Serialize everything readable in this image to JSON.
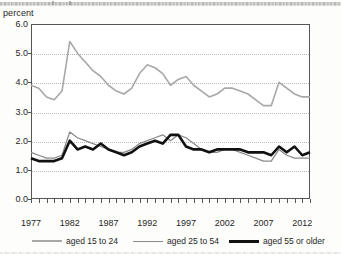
{
  "axis_title": "percent",
  "legend": {
    "items": [
      {
        "label": "aged 15 to 24",
        "color": "#a8a8a8"
      },
      {
        "label": "aged 25 to 54",
        "color": "#8a8a8a"
      },
      {
        "label": "aged 55 or older",
        "color": "#111111"
      }
    ]
  },
  "yticks": [
    "0.0",
    "1.0",
    "2.0",
    "3.0",
    "4.0",
    "5.0",
    "6.0"
  ],
  "xticks": [
    "1977",
    "1982",
    "1987",
    "1992",
    "1997",
    "2002",
    "2007",
    "2012"
  ],
  "chart_data": {
    "type": "line",
    "title": "",
    "xlabel": "",
    "ylabel": "percent",
    "ylim": [
      0.0,
      6.0
    ],
    "xlim": [
      1977,
      2013
    ],
    "grid": true,
    "legend_position": "bottom",
    "x": [
      1977,
      1978,
      1979,
      1980,
      1981,
      1982,
      1983,
      1984,
      1985,
      1986,
      1987,
      1988,
      1989,
      1990,
      1991,
      1992,
      1993,
      1994,
      1995,
      1996,
      1997,
      1998,
      1999,
      2000,
      2001,
      2002,
      2003,
      2004,
      2005,
      2006,
      2007,
      2008,
      2009,
      2010,
      2011,
      2012,
      2013
    ],
    "series": [
      {
        "name": "aged 15 to 24",
        "color": "#a8a8a8",
        "values": [
          3.9,
          3.8,
          3.5,
          3.4,
          3.7,
          5.4,
          5.0,
          4.7,
          4.4,
          4.2,
          3.9,
          3.7,
          3.6,
          3.8,
          4.3,
          4.6,
          4.5,
          4.3,
          3.9,
          4.1,
          4.2,
          3.9,
          3.7,
          3.5,
          3.6,
          3.8,
          3.8,
          3.7,
          3.6,
          3.4,
          3.2,
          3.2,
          4.0,
          3.8,
          3.6,
          3.5,
          3.5
        ]
      },
      {
        "name": "aged 25 to 54",
        "color": "#8a8a8a",
        "values": [
          1.6,
          1.5,
          1.4,
          1.4,
          1.5,
          2.3,
          2.1,
          2.0,
          1.9,
          1.8,
          1.7,
          1.6,
          1.6,
          1.7,
          1.9,
          2.0,
          2.1,
          2.2,
          2.0,
          2.2,
          2.1,
          1.9,
          1.7,
          1.6,
          1.6,
          1.7,
          1.7,
          1.6,
          1.5,
          1.4,
          1.3,
          1.3,
          1.7,
          1.5,
          1.4,
          1.4,
          1.4
        ]
      },
      {
        "name": "aged 55 or older",
        "color": "#111111",
        "values": [
          1.4,
          1.3,
          1.3,
          1.3,
          1.4,
          2.0,
          1.7,
          1.8,
          1.7,
          1.9,
          1.7,
          1.6,
          1.5,
          1.6,
          1.8,
          1.9,
          2.0,
          1.9,
          2.2,
          2.2,
          1.8,
          1.7,
          1.7,
          1.6,
          1.7,
          1.7,
          1.7,
          1.7,
          1.6,
          1.6,
          1.6,
          1.5,
          1.8,
          1.6,
          1.8,
          1.5,
          1.6
        ]
      }
    ]
  }
}
